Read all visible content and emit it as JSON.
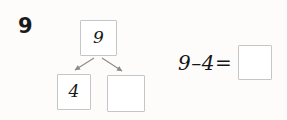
{
  "exercise": {
    "number": "9"
  },
  "number_bond": {
    "whole": {
      "value": "9",
      "filled": true
    },
    "parts": [
      {
        "value": "4",
        "filled": true
      },
      {
        "value": "",
        "filled": false
      }
    ],
    "arrow_color": "#8a8a8a",
    "box_border_color": "#c6c6c6"
  },
  "equation": {
    "expression": "9–4=",
    "minuend": "9",
    "operator": "–",
    "subtrahend": "4",
    "equals": "=",
    "answer": "",
    "answer_filled": false
  },
  "colors": {
    "background": "#fdfcfb",
    "ink": "#181818",
    "box_border": "#c6c6c6",
    "arrow": "#8a8a8a"
  }
}
